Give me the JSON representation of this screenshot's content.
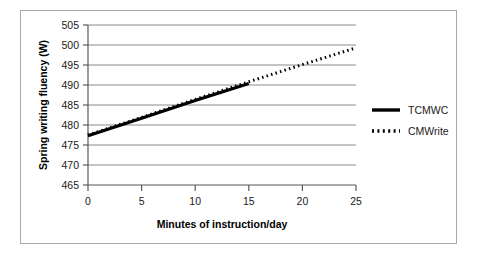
{
  "chart_data": {
    "type": "line",
    "title": "",
    "xlabel": "Minutes of instruction/day",
    "ylabel": "Spring writing fluency (W)",
    "xlim": [
      0,
      25
    ],
    "ylim": [
      465,
      505
    ],
    "x_ticks": [
      0,
      5,
      10,
      15,
      20,
      25
    ],
    "y_ticks": [
      465,
      470,
      475,
      480,
      485,
      490,
      495,
      500,
      505
    ],
    "grid": "horizontal",
    "legend_position": "right",
    "series": [
      {
        "name": "TCMWC",
        "style": "solid",
        "color": "#000000",
        "x": [
          0,
          5,
          10,
          15
        ],
        "values": [
          477.3,
          481.7,
          486.1,
          490.4
        ]
      },
      {
        "name": "CMWrite",
        "style": "dotted",
        "color": "#000000",
        "x": [
          0,
          5,
          10,
          15,
          20,
          25
        ],
        "values": [
          477.5,
          481.9,
          486.4,
          490.8,
          495.1,
          499.3
        ]
      }
    ]
  },
  "axes": {
    "y_label": "Spring writing fluency (W)",
    "x_label": "Minutes of instruction/day",
    "y_tick_labels": [
      "505",
      "500",
      "495",
      "490",
      "485",
      "480",
      "475",
      "470",
      "465"
    ],
    "x_tick_labels": [
      "0",
      "5",
      "10",
      "15",
      "20",
      "25"
    ]
  },
  "legend": {
    "entries": [
      {
        "label": "TCMWC",
        "style": "solid"
      },
      {
        "label": "CMWrite",
        "style": "dotted"
      }
    ]
  }
}
